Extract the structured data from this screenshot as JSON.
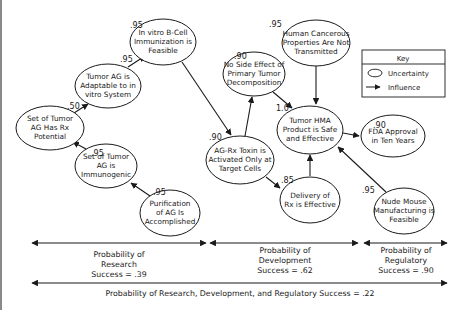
{
  "diagram": {
    "nodes": [
      {
        "id": "rx_potential",
        "lines": [
          "Set of Tumor",
          "AG Has Rx",
          "Potential"
        ],
        "prob": ".50"
      },
      {
        "id": "adaptable",
        "lines": [
          "Tumor AG is",
          "Adaptable to in",
          "vitro System"
        ],
        "prob": ".95"
      },
      {
        "id": "bcell",
        "lines": [
          "In vitro B-Cell",
          "Immunization is",
          "Feasible"
        ],
        "prob": ".95"
      },
      {
        "id": "immunogenic",
        "lines": [
          "Set of Tumor",
          "AG is",
          "Immunogenic"
        ],
        "prob": ".95"
      },
      {
        "id": "purification",
        "lines": [
          "Purification",
          "of AG Is",
          "Accomplished"
        ],
        "prob": ".95"
      },
      {
        "id": "no_side_effect",
        "lines": [
          "No Side Effect of",
          "Primary Tumor",
          "Decomposition"
        ],
        "prob": ".90"
      },
      {
        "id": "human_cancerous",
        "lines": [
          "Human Cancerous",
          "Properties Are Not",
          "Transmitted"
        ],
        "prob": ".95"
      },
      {
        "id": "toxin",
        "lines": [
          "AG-Rx Toxin is",
          "Activated Only at",
          "Target Cells"
        ],
        "prob": ".90"
      },
      {
        "id": "hma_safe",
        "lines": [
          "Tumor HMA",
          "Product is Safe",
          "and Effective"
        ],
        "prob": "1.0"
      },
      {
        "id": "delivery",
        "lines": [
          "Delivery of",
          "Rx is Effective"
        ],
        "prob": ".85"
      },
      {
        "id": "fda",
        "lines": [
          "FDA Approval",
          "in Ten Years"
        ],
        "prob": ".90"
      },
      {
        "id": "nude_mouse",
        "lines": [
          "Nude Mouse",
          "Manufacturing is",
          "Feasible"
        ],
        "prob": ".95"
      }
    ],
    "edges": [
      {
        "from": "purification",
        "to": "immunogenic"
      },
      {
        "from": "immunogenic",
        "to": "rx_potential"
      },
      {
        "from": "rx_potential",
        "to": "adaptable"
      },
      {
        "from": "adaptable",
        "to": "bcell"
      },
      {
        "from": "bcell",
        "to": "toxin"
      },
      {
        "from": "toxin",
        "to": "no_side_effect"
      },
      {
        "from": "toxin",
        "to": "delivery"
      },
      {
        "from": "no_side_effect",
        "to": "hma_safe"
      },
      {
        "from": "human_cancerous",
        "to": "hma_safe"
      },
      {
        "from": "delivery",
        "to": "hma_safe"
      },
      {
        "from": "nude_mouse",
        "to": "hma_safe"
      },
      {
        "from": "hma_safe",
        "to": "fda"
      }
    ]
  },
  "key": {
    "title": "Key",
    "uncertainty_label": "Uncertainty",
    "influence_label": "Influence"
  },
  "phases": {
    "research": [
      "Probability of",
      "Research",
      "Success = .39"
    ],
    "development": [
      "Probability of",
      "Development",
      "Success = .62"
    ],
    "regulatory": [
      "Probability of",
      "Regulatory",
      "Success = .90"
    ],
    "overall": "Probability of Research, Development, and Regulatory Success = .22"
  },
  "colors": {
    "line": "#1a1a1a",
    "text": "#1a1a1a",
    "background": "#ffffff"
  }
}
